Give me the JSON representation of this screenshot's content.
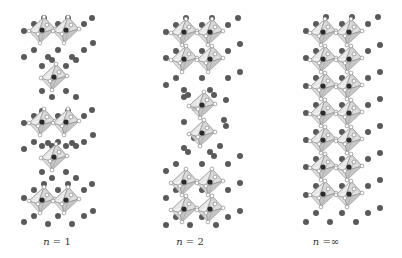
{
  "figure": {
    "type": "crystal-structure-diagram",
    "colors": {
      "background": "#ffffff",
      "octahedron_fill": "#d9d9d9",
      "octahedron_face_dark": "#bcbcbc",
      "octahedron_face_light": "#ececec",
      "octahedron_edge": "#8a8a8a",
      "b_site_atom": "#2a2a2a",
      "x_site_atom_fill": "#ffffff",
      "x_site_atom_stroke": "#777777",
      "a_site_atom": "#5a5a5a",
      "label_text": "#333333"
    },
    "octahedron_size": 13,
    "panels": [
      {
        "id": "n1",
        "label_var": "n",
        "label_rest": " = 1",
        "label_x": 57,
        "label_y": 236,
        "octahedra": [
          [
            42,
            30
          ],
          [
            66,
            30
          ],
          [
            54,
            77
          ],
          [
            42,
            122
          ],
          [
            66,
            122
          ],
          [
            54,
            157
          ],
          [
            42,
            200
          ],
          [
            66,
            200
          ]
        ],
        "a_atoms": [
          [
            44,
            18
          ],
          [
            68,
            18
          ],
          [
            92,
            18
          ],
          [
            34,
            24
          ],
          [
            58,
            24
          ],
          [
            84,
            24
          ],
          [
            24,
            31
          ],
          [
            93,
            43
          ],
          [
            34,
            50
          ],
          [
            58,
            50
          ],
          [
            84,
            50
          ],
          [
            24,
            57
          ],
          [
            48,
            57
          ],
          [
            52,
            60
          ],
          [
            72,
            57
          ],
          [
            76,
            60
          ],
          [
            42,
            66
          ],
          [
            66,
            66
          ],
          [
            42,
            91
          ],
          [
            66,
            91
          ],
          [
            52,
            97
          ],
          [
            76,
            97
          ],
          [
            42,
            111
          ],
          [
            68,
            111
          ],
          [
            92,
            110
          ],
          [
            34,
            116
          ],
          [
            58,
            116
          ],
          [
            84,
            116
          ],
          [
            24,
            123
          ],
          [
            93,
            135
          ],
          [
            34,
            142
          ],
          [
            58,
            142
          ],
          [
            84,
            142
          ],
          [
            24,
            149
          ],
          [
            48,
            143
          ],
          [
            52,
            146
          ],
          [
            72,
            143
          ],
          [
            76,
            146
          ],
          [
            42,
            146
          ],
          [
            66,
            146
          ],
          [
            42,
            172
          ],
          [
            66,
            172
          ],
          [
            52,
            178
          ],
          [
            76,
            178
          ],
          [
            44,
            184
          ],
          [
            68,
            184
          ],
          [
            92,
            184
          ],
          [
            34,
            190
          ],
          [
            58,
            190
          ],
          [
            84,
            190
          ],
          [
            24,
            198
          ],
          [
            93,
            211
          ],
          [
            34,
            216
          ],
          [
            58,
            216
          ],
          [
            84,
            216
          ],
          [
            24,
            222
          ],
          [
            48,
            224
          ],
          [
            72,
            224
          ]
        ]
      },
      {
        "id": "n2",
        "label_var": "n",
        "label_rest": " = 2",
        "label_x": 190,
        "label_y": 236,
        "octahedra": [
          [
            184,
            32
          ],
          [
            210,
            32
          ],
          [
            184,
            59
          ],
          [
            210,
            59
          ],
          [
            202,
            105
          ],
          [
            202,
            133
          ],
          [
            184,
            182
          ],
          [
            210,
            182
          ],
          [
            184,
            209
          ],
          [
            210,
            209
          ]
        ],
        "a_atoms": [
          [
            186,
            18
          ],
          [
            212,
            18
          ],
          [
            238,
            18
          ],
          [
            176,
            25
          ],
          [
            202,
            25
          ],
          [
            228,
            25
          ],
          [
            166,
            32
          ],
          [
            240,
            44
          ],
          [
            176,
            51
          ],
          [
            202,
            51
          ],
          [
            228,
            51
          ],
          [
            166,
            58
          ],
          [
            176,
            78
          ],
          [
            202,
            78
          ],
          [
            228,
            78
          ],
          [
            166,
            85
          ],
          [
            240,
            72
          ],
          [
            184,
            90
          ],
          [
            188,
            95
          ],
          [
            210,
            90
          ],
          [
            214,
            95
          ],
          [
            184,
            97
          ],
          [
            226,
            100
          ],
          [
            195,
            108
          ],
          [
            224,
            120
          ],
          [
            184,
            122
          ],
          [
            226,
            126
          ],
          [
            194,
            138
          ],
          [
            220,
            146
          ],
          [
            184,
            148
          ],
          [
            188,
            152
          ],
          [
            210,
            152
          ],
          [
            214,
            156
          ],
          [
            240,
            156
          ],
          [
            176,
            164
          ],
          [
            202,
            164
          ],
          [
            228,
            164
          ],
          [
            166,
            171
          ],
          [
            240,
            183
          ],
          [
            176,
            190
          ],
          [
            202,
            190
          ],
          [
            228,
            190
          ],
          [
            166,
            198
          ],
          [
            176,
            217
          ],
          [
            202,
            217
          ],
          [
            228,
            217
          ],
          [
            166,
            225
          ],
          [
            240,
            211
          ],
          [
            190,
            225
          ],
          [
            216,
            225
          ]
        ]
      },
      {
        "id": "ninf",
        "label_var": "n",
        "label_rest": " =∞",
        "label_x": 326,
        "label_y": 236,
        "octahedra": [
          [
            323,
            32
          ],
          [
            349,
            32
          ],
          [
            323,
            59
          ],
          [
            349,
            59
          ],
          [
            323,
            86
          ],
          [
            349,
            86
          ],
          [
            323,
            113
          ],
          [
            349,
            113
          ],
          [
            323,
            140
          ],
          [
            349,
            140
          ],
          [
            323,
            167
          ],
          [
            349,
            167
          ],
          [
            323,
            194
          ],
          [
            349,
            194
          ]
        ],
        "a_atoms": [
          [
            326,
            17
          ],
          [
            352,
            17
          ],
          [
            378,
            17
          ],
          [
            316,
            24
          ],
          [
            342,
            24
          ],
          [
            368,
            24
          ],
          [
            306,
            31
          ],
          [
            380,
            45
          ],
          [
            316,
            51
          ],
          [
            342,
            51
          ],
          [
            368,
            51
          ],
          [
            306,
            58
          ],
          [
            316,
            78
          ],
          [
            342,
            78
          ],
          [
            368,
            78
          ],
          [
            306,
            86
          ],
          [
            380,
            72
          ],
          [
            316,
            105
          ],
          [
            342,
            105
          ],
          [
            368,
            105
          ],
          [
            306,
            113
          ],
          [
            380,
            99
          ],
          [
            316,
            132
          ],
          [
            342,
            132
          ],
          [
            368,
            132
          ],
          [
            306,
            140
          ],
          [
            380,
            126
          ],
          [
            316,
            159
          ],
          [
            342,
            159
          ],
          [
            368,
            159
          ],
          [
            306,
            167
          ],
          [
            380,
            153
          ],
          [
            316,
            186
          ],
          [
            342,
            186
          ],
          [
            368,
            186
          ],
          [
            306,
            195
          ],
          [
            380,
            180
          ],
          [
            316,
            213
          ],
          [
            342,
            213
          ],
          [
            368,
            213
          ],
          [
            306,
            222
          ],
          [
            380,
            208
          ],
          [
            330,
            222
          ],
          [
            356,
            222
          ]
        ]
      }
    ]
  }
}
